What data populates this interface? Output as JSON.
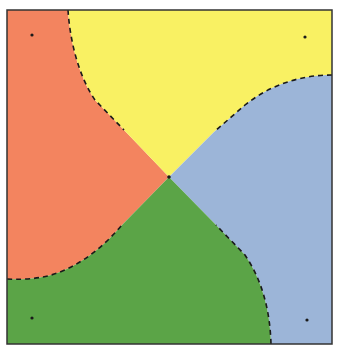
{
  "diagram": {
    "type": "voronoi-like-region-partition",
    "frame": {
      "x": 7,
      "y": 10,
      "width": 325,
      "height": 334,
      "stroke": "#333333"
    },
    "center_point": {
      "x": 169,
      "y": 177
    },
    "regions": [
      {
        "name": "top-left",
        "color": "#f3845f",
        "site": {
          "x": 32,
          "y": 35
        }
      },
      {
        "name": "top-right",
        "color": "#f9f163",
        "site": {
          "x": 305,
          "y": 37
        }
      },
      {
        "name": "bottom-left",
        "color": "#5ba447",
        "site": {
          "x": 32,
          "y": 318
        }
      },
      {
        "name": "bottom-right",
        "color": "#9cb5d8",
        "site": {
          "x": 307,
          "y": 320
        }
      }
    ],
    "boundaries": [
      {
        "between": [
          "top-left",
          "top-right"
        ],
        "style": "dashed"
      },
      {
        "between": [
          "top-right",
          "bottom-right"
        ],
        "style": "dashed"
      },
      {
        "between": [
          "top-left",
          "bottom-left"
        ],
        "style": "dashed"
      },
      {
        "between": [
          "bottom-left",
          "bottom-right"
        ],
        "style": "dashed"
      }
    ]
  }
}
